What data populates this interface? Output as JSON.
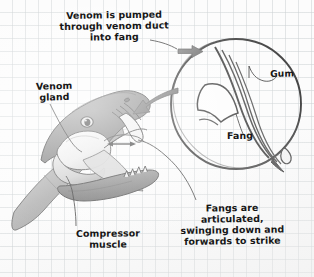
{
  "diagram": {
    "medium": "hand-drawn pencil and ink sketch on graph paper",
    "paper": {
      "background_color": "#fcfcfc",
      "grid_color": "#cdd2d4",
      "grid_size_px": 13
    },
    "ink_color": "#171717",
    "arrow_color": "#7b7b7b"
  },
  "captions": {
    "venom_duct": "Venom is pumped\nthrough venom duct\ninto fang",
    "venom_gland": "Venom\ngland",
    "compressor_muscle": "Compressor\nmuscle",
    "fangs_articulated": "Fangs are\narticulated,\nswinging down and\nforwards to strike",
    "gum": "Gum",
    "fang": "Fang"
  },
  "figures": {
    "snake_head": {
      "name": "snake-head-cutaway",
      "description": "grey shaded side view of a snake head with jaws open wide, showing venom gland, compressor muscle, fang and lower jaw teeth"
    },
    "inset_circle": {
      "name": "fang-magnified-inset",
      "description": "circular magnified cutaway of the fang showing gum, venom duct channel and a venom droplet at the fang tip"
    }
  },
  "arrows": {
    "into_fang": "arrow pointing right into the magnified inset",
    "inset_to_head": "large curved arrow pointing left from the inset to the snake fang",
    "articulation": "small double-headed arrow at the fang showing swing direction"
  }
}
